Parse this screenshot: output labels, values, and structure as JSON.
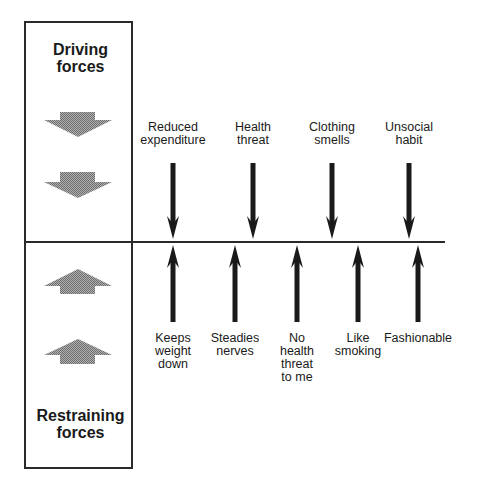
{
  "diagram": {
    "type": "force-field-analysis",
    "panel": {
      "driving_title": "Driving\nforces",
      "restraining_title": "Restraining\nforces",
      "gray_arrow_color": "#9a9a9a"
    },
    "driving_forces": [
      {
        "label": "Reduced\nexpenditure",
        "x": 173
      },
      {
        "label": "Health\nthreat",
        "x": 253
      },
      {
        "label": "Clothing\nsmells",
        "x": 332
      },
      {
        "label": "Unsocial\nhabit",
        "x": 409
      }
    ],
    "restraining_forces": [
      {
        "label": "Keeps\nweight\ndown",
        "x": 173
      },
      {
        "label": "Steadies\nnerves",
        "x": 235
      },
      {
        "label": "No\nhealth\nthreat\nto me",
        "x": 297
      },
      {
        "label": "Like\nsmoking",
        "x": 358
      },
      {
        "label": "Fashionable",
        "x": 418
      }
    ],
    "arrow_color": "#1a1a1a",
    "line_color": "#2a2a2a"
  }
}
